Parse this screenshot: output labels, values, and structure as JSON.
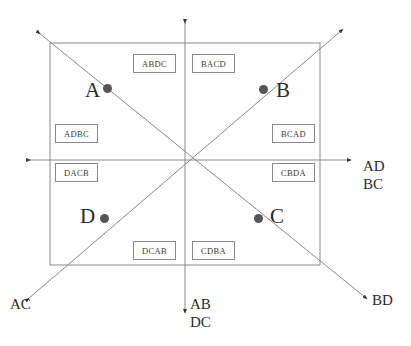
{
  "diagram": {
    "frame": {
      "x": 50,
      "y": 43,
      "width": 270,
      "height": 222
    },
    "center": {
      "x": 185,
      "y": 160
    },
    "colors": {
      "line": "#8a8a8a",
      "dot": "#555555",
      "text": "#2b2b2b",
      "box_border": "#8a8a8a",
      "background": "#ffffff"
    }
  },
  "permutation_boxes": [
    {
      "label": "ABDC",
      "x": 133,
      "y": 54,
      "w": 43,
      "h": 19
    },
    {
      "label": "BACD",
      "x": 192,
      "y": 54,
      "w": 43,
      "h": 19
    },
    {
      "label": "ADBC",
      "x": 55,
      "y": 124,
      "w": 43,
      "h": 19
    },
    {
      "label": "BCAD",
      "x": 272,
      "y": 124,
      "w": 43,
      "h": 19
    },
    {
      "label": "DACB",
      "x": 55,
      "y": 163,
      "w": 43,
      "h": 19
    },
    {
      "label": "CBDA",
      "x": 272,
      "y": 163,
      "w": 43,
      "h": 19
    },
    {
      "label": "DCAB",
      "x": 133,
      "y": 241,
      "w": 43,
      "h": 19
    },
    {
      "label": "CDBA",
      "x": 192,
      "y": 241,
      "w": 43,
      "h": 19
    }
  ],
  "points": [
    {
      "id": "A",
      "label": "A",
      "dot_x": 107,
      "dot_y": 88,
      "label_x": 85,
      "label_y": 80
    },
    {
      "id": "B",
      "label": "B",
      "dot_x": 263,
      "dot_y": 89,
      "label_x": 276,
      "label_y": 80
    },
    {
      "id": "C",
      "label": "C",
      "dot_x": 258,
      "dot_y": 218,
      "label_x": 270,
      "label_y": 206
    },
    {
      "id": "D",
      "label": "D",
      "dot_x": 104,
      "dot_y": 218,
      "label_x": 80,
      "label_y": 206
    }
  ],
  "axis_labels": [
    {
      "name": "right",
      "lines": [
        "AD",
        "BC"
      ],
      "x": 363,
      "y": 166
    },
    {
      "name": "bottom",
      "lines": [
        "AB",
        "DC"
      ],
      "x": 190,
      "y": 302
    },
    {
      "name": "bottom-left",
      "lines": [
        "AC"
      ],
      "x": 10,
      "y": 300
    },
    {
      "name": "bottom-right",
      "lines": [
        "BD"
      ],
      "x": 372,
      "y": 296
    }
  ]
}
